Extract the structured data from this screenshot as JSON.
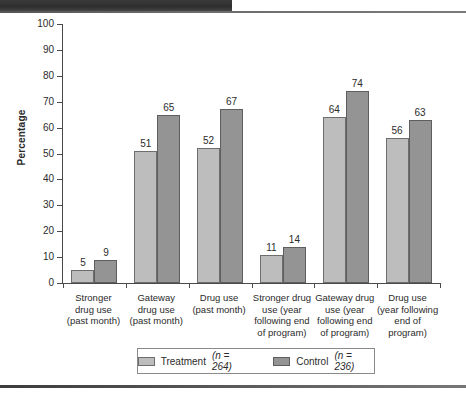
{
  "chart_data": {
    "type": "bar",
    "title": "",
    "xlabel": "",
    "ylabel": "Percentage",
    "ylim": [
      0,
      100
    ],
    "yticks": [
      0,
      10,
      20,
      30,
      40,
      50,
      60,
      70,
      80,
      90,
      100
    ],
    "grid": false,
    "legend_position": "bottom",
    "categories": [
      "Stronger drug use (past month)",
      "Gateway drug use (past month)",
      "Drug use (past month)",
      "Stronger drug use (year following end of program)",
      "Gateway drug use (year following end of program)",
      "Drug use (year following end of program)"
    ],
    "category_lines": [
      [
        "Stronger",
        "drug use",
        "(past month)"
      ],
      [
        "Gateway",
        "drug use",
        "(past month)"
      ],
      [
        "Drug use",
        "(past month)"
      ],
      [
        "Stronger drug",
        "use (year",
        "following end",
        "of program)"
      ],
      [
        "Gateway drug",
        "use (year",
        "following end",
        "of program)"
      ],
      [
        "Drug use",
        "(year following",
        "end of",
        "program)"
      ]
    ],
    "series": [
      {
        "name": "Treatment",
        "n": 264,
        "color": "#bdbdbd",
        "values": [
          5,
          51,
          52,
          11,
          64,
          56
        ]
      },
      {
        "name": "Control",
        "n": 236,
        "color": "#949494",
        "values": [
          9,
          65,
          67,
          14,
          74,
          63
        ]
      }
    ]
  },
  "legend": {
    "items": [
      {
        "label": "Treatment",
        "n_text": "(n = 264)"
      },
      {
        "label": "Control",
        "n_text": "(n = 236)"
      }
    ]
  }
}
